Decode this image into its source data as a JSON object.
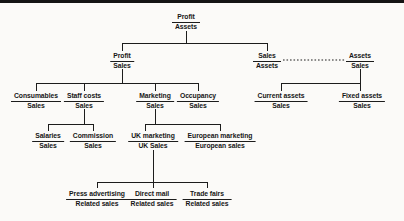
{
  "diagram": {
    "nodes": [
      {
        "id": "profit-assets",
        "num": "Profit",
        "den": "Assets"
      },
      {
        "id": "profit-sales",
        "num": "Profit",
        "den": "Sales"
      },
      {
        "id": "sales-assets",
        "num": "Sales",
        "den": "Assets"
      },
      {
        "id": "assets-sales",
        "num": "Assets",
        "den": "Sales"
      },
      {
        "id": "consumables",
        "num": "Consumables",
        "den": "Sales"
      },
      {
        "id": "staff-costs",
        "num": "Staff costs",
        "den": "Sales"
      },
      {
        "id": "marketing",
        "num": "Marketing",
        "den": "Sales"
      },
      {
        "id": "occupancy",
        "num": "Occupancy",
        "den": "Sales"
      },
      {
        "id": "current-assets",
        "num": "Current assets",
        "den": "Sales"
      },
      {
        "id": "fixed-assets",
        "num": "Fixed assets",
        "den": "Sales"
      },
      {
        "id": "salaries",
        "num": "Salaries",
        "den": "Sales"
      },
      {
        "id": "commission",
        "num": "Commission",
        "den": "Sales"
      },
      {
        "id": "uk-marketing",
        "num": "UK marketing",
        "den": "UK Sales"
      },
      {
        "id": "european-marketing",
        "num": "European marketing",
        "den": "European sales"
      },
      {
        "id": "press-advertising",
        "num": "Press advertising",
        "den": "Related sales"
      },
      {
        "id": "direct-mail",
        "num": "Direct mail",
        "den": "Related sales"
      },
      {
        "id": "trade-fairs",
        "num": "Trade fairs",
        "den": "Related sales"
      }
    ]
  },
  "colors": {
    "line_color": "#1c1c1c",
    "text_color": "#161616",
    "bg_color": "#fbfaf8",
    "rule_color": "#141414"
  }
}
